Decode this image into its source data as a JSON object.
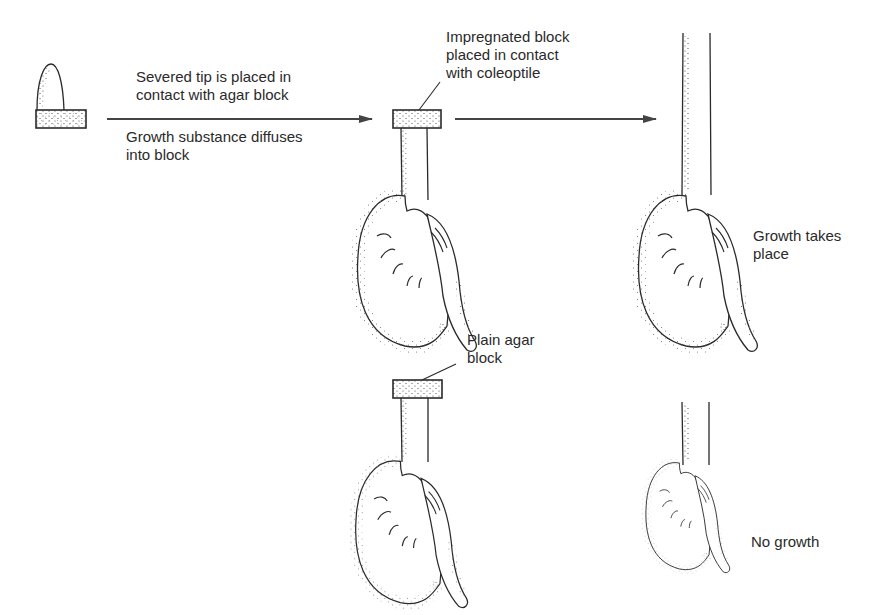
{
  "colors": {
    "ink": "#2a2a2a",
    "stipple": "#555555",
    "background": "#ffffff"
  },
  "labels": {
    "step1_top": [
      "Severed tip is placed in",
      "contact with agar block"
    ],
    "step1_bottom": [
      "Growth substance diffuses",
      "into block"
    ],
    "impregnated": [
      "Impregnated block",
      "placed in contact",
      "with coleoptile"
    ],
    "plain": [
      "Plain agar",
      "block"
    ],
    "growth": [
      "Growth takes",
      "place"
    ],
    "no_growth": [
      "No growth"
    ]
  },
  "figures": [
    {
      "id": "severed-tip-on-agar",
      "description": "Severed coleoptile tip resting on agar block"
    },
    {
      "id": "coleoptile-with-impregnated-block",
      "description": "Decapitated coleoptile with impregnated agar block"
    },
    {
      "id": "coleoptile-grown",
      "description": "Coleoptile after growth (elongated)"
    },
    {
      "id": "coleoptile-with-plain-block",
      "description": "Decapitated coleoptile with plain agar block"
    },
    {
      "id": "coleoptile-no-growth",
      "description": "Coleoptile with no growth"
    }
  ],
  "arrows": [
    {
      "id": "arrow-1",
      "from": "severed-tip-on-agar",
      "to": "coleoptile-with-impregnated-block"
    },
    {
      "id": "arrow-2",
      "from": "coleoptile-with-impregnated-block",
      "to": "coleoptile-grown"
    }
  ]
}
